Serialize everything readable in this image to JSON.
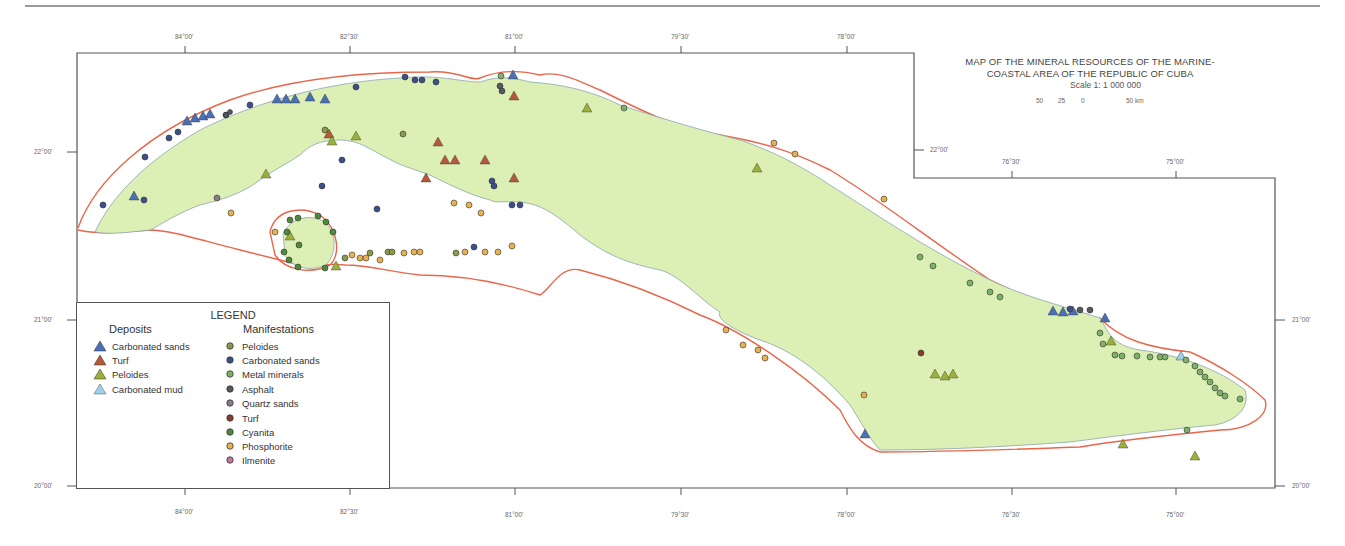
{
  "title": {
    "line1": "MAP OF THE MINERAL RESOURCES OF THE MARINE-",
    "line2": "COASTAL AREA OF THE REPUBLIC OF CUBA"
  },
  "scale": {
    "label": "Scale 1: 1 000 000",
    "ticks": [
      "50",
      "25",
      "0",
      "50 km"
    ]
  },
  "axes": {
    "top_longitudes": [
      "84°00'",
      "82°30'",
      "81°00'",
      "79°30'",
      "78°00'"
    ],
    "top_right_longitudes": [
      "76°30'",
      "75°00'"
    ],
    "bottom_longitudes": [
      "84°00'",
      "82°30'",
      "81°00'",
      "79°30'",
      "78°00'",
      "76°30'",
      "75°00'"
    ],
    "left_latitudes": [
      "22°00'",
      "21°00'",
      "20°00'"
    ],
    "right_latitudes": [
      "22°00'",
      "21°00'",
      "20°00'"
    ]
  },
  "legend": {
    "title": "LEGEND",
    "deposits_title": "Deposits",
    "manifestations_title": "Manifestations",
    "deposits": [
      {
        "label": "Carbonated sands",
        "color": "#4a6fb5",
        "symbol": "triangle"
      },
      {
        "label": "Turf",
        "color": "#b5593a",
        "symbol": "triangle"
      },
      {
        "label": "Peloides",
        "color": "#9ab03a",
        "symbol": "triangle"
      },
      {
        "label": "Carbonated mud",
        "color": "#9fd0ea",
        "symbol": "triangle"
      }
    ],
    "manifestations": [
      {
        "label": "Peloides",
        "color": "#8a9a4a",
        "symbol": "circle"
      },
      {
        "label": "Carbonated sands",
        "color": "#3b4f8a",
        "symbol": "circle"
      },
      {
        "label": "Metal minerals",
        "color": "#7fb06a",
        "symbol": "circle"
      },
      {
        "label": "Asphalt",
        "color": "#555860",
        "symbol": "circle"
      },
      {
        "label": "Quartz sands",
        "color": "#8a7a8a",
        "symbol": "circle"
      },
      {
        "label": "Turf",
        "color": "#8a3a2a",
        "symbol": "circle"
      },
      {
        "label": "Cyanita",
        "color": "#4f8a3a",
        "symbol": "circle"
      },
      {
        "label": "Phosphorite",
        "color": "#e8b050",
        "symbol": "circle"
      },
      {
        "label": "Ilmenite",
        "color": "#c07a9a",
        "symbol": "circle"
      }
    ]
  },
  "colors": {
    "land": "#dcefb4",
    "coast": "#8aa6b0",
    "shelf_edge": "#e8664a",
    "frame": "#555555"
  }
}
